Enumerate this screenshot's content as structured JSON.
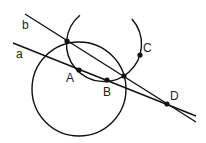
{
  "diagram": {
    "type": "geometry",
    "stroke_color": "#111111",
    "background": "#ffffff",
    "lines": [
      {
        "label": "a",
        "x1": 13,
        "y1": 43,
        "x2": 196,
        "y2": 116,
        "label_x": 16,
        "label_y": 58
      },
      {
        "label": "b",
        "x1": 25,
        "y1": 14,
        "x2": 196,
        "y2": 122,
        "label_x": 22,
        "label_y": 29
      }
    ],
    "circles": [
      {
        "name": "large-circle",
        "cx": 79,
        "cy": 89,
        "r": 47
      },
      {
        "name": "small-circle-arc",
        "cx": 104,
        "cy": 44,
        "r": 37.5,
        "gap_start_deg": 230,
        "gap_end_deg": 318
      }
    ],
    "points": [
      {
        "label": "A",
        "x": 79,
        "y": 70,
        "label_x": 66,
        "label_y": 82
      },
      {
        "label": "B",
        "x": 107,
        "y": 80,
        "label_x": 103,
        "label_y": 96
      },
      {
        "label": "C",
        "x": 140,
        "y": 55,
        "label_x": 143,
        "label_y": 52
      },
      {
        "label": "D",
        "x": 167,
        "y": 104,
        "label_x": 170,
        "label_y": 100
      },
      {
        "label": "",
        "x": 67,
        "y": 41
      },
      {
        "label": "",
        "x": 124,
        "y": 76
      }
    ]
  }
}
